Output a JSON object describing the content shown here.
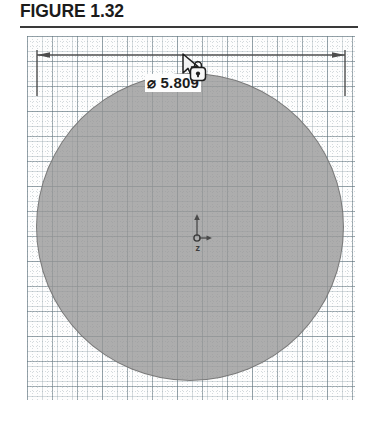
{
  "figure": {
    "caption": "FIGURE 1.32"
  },
  "drawing": {
    "dimension": {
      "symbol": "⌀",
      "value": "5.809",
      "label": "⌀ 5.809",
      "type": "diameter",
      "orientation": "horizontal",
      "terminators": "arrows"
    },
    "circle": {
      "diameter": "5.809",
      "fill_color": "#969696",
      "stroke_color": "#696969"
    },
    "origin_marker": {
      "name": "origin",
      "axes": [
        "y-up",
        "x-right"
      ]
    },
    "grid": {
      "minor_color": "#788c96",
      "major_color": "#5f737d",
      "minor_spacing_px": 5,
      "major_spacing_px": 25,
      "background": "#fdfdfd"
    },
    "cursor": {
      "icon": "pointer-with-lock-badge",
      "badge": "lock-icon"
    }
  }
}
